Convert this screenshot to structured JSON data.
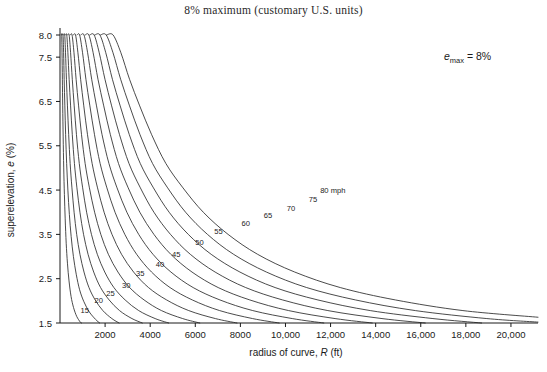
{
  "figure": {
    "title": "8% maximum (customary U.S. units)",
    "annotation": {
      "symbol": "e",
      "subscript": "max",
      "equals": "=",
      "value": "8%",
      "full": "emax = 8%"
    }
  },
  "axes": {
    "x": {
      "label_prefix": "radius of curve, ",
      "label_symbol": "R",
      "label_units": " (ft)",
      "label_full": "radius of curve, R (ft)",
      "min": 0,
      "max": 21200,
      "ticks": [
        2000,
        4000,
        6000,
        8000,
        10000,
        12000,
        14000,
        16000,
        18000,
        20000
      ],
      "tick_labels": [
        "2000",
        "4000",
        "6000",
        "8000",
        "10,000",
        "12,000",
        "14,000",
        "16,000",
        "18,000",
        "20,000"
      ]
    },
    "y": {
      "label_prefix": "superelevation, ",
      "label_symbol": "e",
      "label_units": " (%)",
      "label_full": "superelevation, e (%)",
      "min": 1.5,
      "max": 8.2,
      "ticks": [
        1.5,
        2.5,
        3.5,
        4.5,
        5.5,
        6.5,
        7.5,
        8.0
      ],
      "tick_labels": [
        "1.5",
        "2.5",
        "3.5",
        "4.5",
        "5.5",
        "6.5",
        "7.5",
        "8.0"
      ]
    }
  },
  "colors": {
    "curve": "#2b2b2b",
    "axis": "#1a1a1a",
    "text": "#1a1a1a",
    "background": "#ffffff"
  },
  "chart_data": {
    "type": "line",
    "title": "8% maximum (customary U.S. units)",
    "xlabel": "radius of curve, R (ft)",
    "ylabel": "superelevation, e (%)",
    "xlim": [
      0,
      21200
    ],
    "ylim": [
      1.5,
      8.2
    ],
    "grid": false,
    "legend": "inline-curve-labels",
    "annotations": [
      {
        "text": "emax = 8%",
        "x": 16000,
        "y": 7.3
      },
      {
        "text": "80 mph",
        "x": 6900,
        "y": 3.95
      }
    ],
    "series": [
      {
        "name": "15",
        "label": "15",
        "label_x": 1100,
        "label_y": 1.72,
        "points": [
          [
            60,
            8.0
          ],
          [
            75,
            8.0
          ],
          [
            90,
            7.6
          ],
          [
            105,
            7.0
          ],
          [
            120,
            6.4
          ],
          [
            140,
            5.7
          ],
          [
            165,
            5.0
          ],
          [
            195,
            4.4
          ],
          [
            230,
            3.85
          ],
          [
            275,
            3.3
          ],
          [
            330,
            2.85
          ],
          [
            400,
            2.45
          ],
          [
            490,
            2.1
          ],
          [
            600,
            1.85
          ],
          [
            740,
            1.65
          ],
          [
            900,
            1.52
          ],
          [
            960,
            1.5
          ]
        ]
      },
      {
        "name": "20",
        "label": "20",
        "label_x": 1720,
        "label_y": 1.95,
        "points": [
          [
            110,
            8.0
          ],
          [
            135,
            8.0
          ],
          [
            160,
            7.6
          ],
          [
            185,
            7.0
          ],
          [
            215,
            6.4
          ],
          [
            250,
            5.75
          ],
          [
            295,
            5.1
          ],
          [
            350,
            4.5
          ],
          [
            415,
            3.95
          ],
          [
            495,
            3.45
          ],
          [
            595,
            3.0
          ],
          [
            720,
            2.6
          ],
          [
            870,
            2.25
          ],
          [
            1060,
            1.98
          ],
          [
            1300,
            1.75
          ],
          [
            1580,
            1.58
          ],
          [
            1760,
            1.5
          ]
        ]
      },
      {
        "name": "25",
        "label": "25",
        "label_x": 2240,
        "label_y": 2.12,
        "points": [
          [
            175,
            8.0
          ],
          [
            210,
            8.0
          ],
          [
            245,
            7.6
          ],
          [
            285,
            7.0
          ],
          [
            330,
            6.4
          ],
          [
            385,
            5.75
          ],
          [
            450,
            5.1
          ],
          [
            530,
            4.55
          ],
          [
            625,
            4.0
          ],
          [
            740,
            3.5
          ],
          [
            885,
            3.05
          ],
          [
            1065,
            2.65
          ],
          [
            1285,
            2.3
          ],
          [
            1560,
            2.02
          ],
          [
            1900,
            1.78
          ],
          [
            2300,
            1.6
          ],
          [
            2620,
            1.5
          ]
        ]
      },
      {
        "name": "30",
        "label": "30",
        "label_x": 2940,
        "label_y": 2.3,
        "points": [
          [
            255,
            8.0
          ],
          [
            300,
            8.0
          ],
          [
            350,
            7.6
          ],
          [
            405,
            7.0
          ],
          [
            470,
            6.4
          ],
          [
            545,
            5.75
          ],
          [
            640,
            5.1
          ],
          [
            750,
            4.55
          ],
          [
            885,
            4.0
          ],
          [
            1045,
            3.5
          ],
          [
            1245,
            3.05
          ],
          [
            1495,
            2.65
          ],
          [
            1800,
            2.3
          ],
          [
            2180,
            2.02
          ],
          [
            2640,
            1.78
          ],
          [
            3190,
            1.6
          ],
          [
            3650,
            1.5
          ]
        ]
      },
      {
        "name": "35",
        "label": "35",
        "label_x": 3560,
        "label_y": 2.55,
        "points": [
          [
            350,
            8.0
          ],
          [
            405,
            8.0
          ],
          [
            470,
            7.6
          ],
          [
            545,
            7.0
          ],
          [
            630,
            6.4
          ],
          [
            730,
            5.75
          ],
          [
            855,
            5.1
          ],
          [
            1005,
            4.55
          ],
          [
            1180,
            4.0
          ],
          [
            1395,
            3.5
          ],
          [
            1655,
            3.05
          ],
          [
            1985,
            2.65
          ],
          [
            2390,
            2.3
          ],
          [
            2890,
            2.02
          ],
          [
            3490,
            1.78
          ],
          [
            4220,
            1.6
          ],
          [
            4820,
            1.5
          ]
        ]
      },
      {
        "name": "40",
        "label": "40",
        "label_x": 4430,
        "label_y": 2.77,
        "points": [
          [
            465,
            8.0
          ],
          [
            535,
            8.0
          ],
          [
            620,
            7.6
          ],
          [
            715,
            7.0
          ],
          [
            825,
            6.4
          ],
          [
            955,
            5.75
          ],
          [
            1115,
            5.1
          ],
          [
            1305,
            4.55
          ],
          [
            1535,
            4.0
          ],
          [
            1810,
            3.5
          ],
          [
            2145,
            3.05
          ],
          [
            2570,
            2.65
          ],
          [
            3090,
            2.3
          ],
          [
            3730,
            2.02
          ],
          [
            4500,
            1.78
          ],
          [
            5440,
            1.6
          ],
          [
            6200,
            1.5
          ]
        ]
      },
      {
        "name": "45",
        "label": "45",
        "label_x": 5160,
        "label_y": 3.0,
        "points": [
          [
            600,
            8.0
          ],
          [
            690,
            8.0
          ],
          [
            795,
            7.6
          ],
          [
            915,
            7.0
          ],
          [
            1055,
            6.4
          ],
          [
            1220,
            5.75
          ],
          [
            1425,
            5.1
          ],
          [
            1665,
            4.55
          ],
          [
            1955,
            4.0
          ],
          [
            2305,
            3.5
          ],
          [
            2730,
            3.05
          ],
          [
            3265,
            2.65
          ],
          [
            3925,
            2.3
          ],
          [
            4730,
            2.02
          ],
          [
            5710,
            1.78
          ],
          [
            6890,
            1.6
          ],
          [
            7850,
            1.5
          ]
        ]
      },
      {
        "name": "50",
        "label": "50",
        "label_x": 6190,
        "label_y": 3.25,
        "points": [
          [
            760,
            8.0
          ],
          [
            870,
            8.0
          ],
          [
            1000,
            7.6
          ],
          [
            1150,
            7.0
          ],
          [
            1325,
            6.4
          ],
          [
            1530,
            5.75
          ],
          [
            1780,
            5.1
          ],
          [
            2080,
            4.55
          ],
          [
            2440,
            4.0
          ],
          [
            2875,
            3.5
          ],
          [
            3400,
            3.05
          ],
          [
            4060,
            2.65
          ],
          [
            4880,
            2.3
          ],
          [
            5870,
            2.02
          ],
          [
            7080,
            1.78
          ],
          [
            8540,
            1.6
          ],
          [
            9720,
            1.5
          ]
        ]
      },
      {
        "name": "55",
        "label": "55",
        "label_x": 7030,
        "label_y": 3.5,
        "points": [
          [
            930,
            8.0
          ],
          [
            1065,
            8.0
          ],
          [
            1225,
            7.6
          ],
          [
            1405,
            7.0
          ],
          [
            1620,
            6.4
          ],
          [
            1865,
            5.75
          ],
          [
            2170,
            5.1
          ],
          [
            2530,
            4.55
          ],
          [
            2965,
            4.0
          ],
          [
            3490,
            3.5
          ],
          [
            4125,
            3.05
          ],
          [
            4920,
            2.65
          ],
          [
            5905,
            2.3
          ],
          [
            7095,
            2.02
          ],
          [
            8550,
            1.78
          ],
          [
            10300,
            1.6
          ],
          [
            11700,
            1.5
          ]
        ]
      },
      {
        "name": "60",
        "label": "60",
        "label_x": 8240,
        "label_y": 3.7,
        "points": [
          [
            1120,
            8.0
          ],
          [
            1280,
            8.0
          ],
          [
            1470,
            7.6
          ],
          [
            1685,
            7.0
          ],
          [
            1940,
            6.4
          ],
          [
            2235,
            5.75
          ],
          [
            2595,
            5.1
          ],
          [
            3025,
            4.55
          ],
          [
            3540,
            4.0
          ],
          [
            4165,
            3.5
          ],
          [
            4915,
            3.05
          ],
          [
            5855,
            2.65
          ],
          [
            7015,
            2.3
          ],
          [
            8420,
            2.02
          ],
          [
            10140,
            1.78
          ],
          [
            12200,
            1.6
          ],
          [
            13850,
            1.5
          ]
        ]
      },
      {
        "name": "65",
        "label": "65",
        "label_x": 9220,
        "label_y": 3.88,
        "points": [
          [
            1325,
            8.0
          ],
          [
            1515,
            8.0
          ],
          [
            1740,
            7.6
          ],
          [
            1995,
            7.0
          ],
          [
            2290,
            6.4
          ],
          [
            2640,
            5.75
          ],
          [
            3060,
            5.1
          ],
          [
            3565,
            4.55
          ],
          [
            4165,
            4.0
          ],
          [
            4900,
            3.5
          ],
          [
            5780,
            3.05
          ],
          [
            6880,
            2.65
          ],
          [
            8235,
            2.3
          ],
          [
            9875,
            2.02
          ],
          [
            11880,
            1.78
          ],
          [
            14280,
            1.6
          ],
          [
            16200,
            1.5
          ]
        ]
      },
      {
        "name": "70",
        "label": "70",
        "label_x": 10240,
        "label_y": 4.03,
        "points": [
          [
            1550,
            8.0
          ],
          [
            1770,
            8.0
          ],
          [
            2030,
            7.6
          ],
          [
            2325,
            7.0
          ],
          [
            2670,
            6.4
          ],
          [
            3075,
            5.75
          ],
          [
            3560,
            5.1
          ],
          [
            4145,
            4.55
          ],
          [
            4840,
            4.0
          ],
          [
            5690,
            3.5
          ],
          [
            6705,
            3.05
          ],
          [
            7980,
            2.65
          ],
          [
            9540,
            2.3
          ],
          [
            11440,
            2.02
          ],
          [
            13760,
            1.78
          ],
          [
            16540,
            1.6
          ],
          [
            18700,
            1.5
          ]
        ]
      },
      {
        "name": "75",
        "label": "75",
        "label_x": 11220,
        "label_y": 4.22,
        "points": [
          [
            1800,
            8.0
          ],
          [
            2050,
            8.0
          ],
          [
            2350,
            7.6
          ],
          [
            2690,
            7.0
          ],
          [
            3085,
            6.4
          ],
          [
            3550,
            5.75
          ],
          [
            4105,
            5.1
          ],
          [
            4775,
            4.55
          ],
          [
            5570,
            4.0
          ],
          [
            6540,
            3.5
          ],
          [
            7700,
            3.05
          ],
          [
            9155,
            2.65
          ],
          [
            10940,
            2.3
          ],
          [
            13110,
            2.02
          ],
          [
            15760,
            1.78
          ],
          [
            18930,
            1.6
          ],
          [
            21200,
            1.52
          ]
        ]
      },
      {
        "name": "80",
        "label": "80 mph",
        "label_x": 12100,
        "label_y": 4.43,
        "points": [
          [
            2070,
            8.0
          ],
          [
            2355,
            8.0
          ],
          [
            2700,
            7.6
          ],
          [
            3085,
            7.0
          ],
          [
            3535,
            6.4
          ],
          [
            4065,
            5.75
          ],
          [
            4695,
            5.1
          ],
          [
            5455,
            4.55
          ],
          [
            6355,
            4.0
          ],
          [
            7455,
            3.5
          ],
          [
            8765,
            3.05
          ],
          [
            10410,
            2.65
          ],
          [
            12430,
            2.3
          ],
          [
            14880,
            2.02
          ],
          [
            17870,
            1.78
          ],
          [
            21200,
            1.63
          ]
        ]
      }
    ]
  }
}
